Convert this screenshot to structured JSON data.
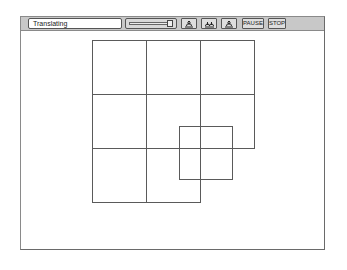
{
  "toolbar": {
    "status_text": "Translating",
    "slider": {
      "value_percent": 95
    },
    "buttons": [
      {
        "name": "rotate-left",
        "icon": "rotate-arrow-icon"
      },
      {
        "name": "rotate-both",
        "icon": "double-rotate-arrow-icon"
      },
      {
        "name": "rotate-right",
        "icon": "rotate-arrow-icon"
      },
      {
        "name": "pause",
        "label": "PAUSE"
      },
      {
        "name": "stop",
        "label": "STOP"
      }
    ]
  },
  "canvas": {
    "grid": {
      "origin": [
        92,
        40
      ],
      "cell_size": 54,
      "cells": [
        [
          0,
          0
        ],
        [
          1,
          0
        ],
        [
          2,
          0
        ],
        [
          0,
          1
        ],
        [
          1,
          1
        ],
        [
          2,
          1
        ],
        [
          0,
          2
        ],
        [
          1,
          2
        ]
      ]
    },
    "moving_square": {
      "x": 179,
      "y": 126,
      "size": 53
    },
    "line_color": "#5a5a5a"
  }
}
